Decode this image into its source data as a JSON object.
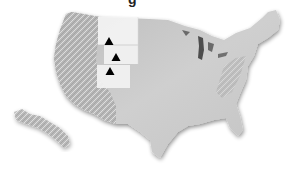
{
  "map": {
    "title_fragment": "g",
    "region": "Contiguous United States and Alaska (inset)",
    "style": "grayscale shaded relief",
    "colors": {
      "land": "#c9c9c9",
      "land_dark": "#a8a8a8",
      "highlight_state": "#f4f4f4",
      "lakes": "#555555",
      "marker": "#000000",
      "background": "#ffffff"
    },
    "highlighted_states": [
      "Montana",
      "Wyoming",
      "Colorado"
    ],
    "markers": [
      {
        "label": "Montana",
        "x": 109,
        "y": 41,
        "symbol": "triangle"
      },
      {
        "label": "Wyoming",
        "x": 116,
        "y": 57,
        "symbol": "triangle"
      },
      {
        "label": "Colorado",
        "x": 110,
        "y": 71,
        "symbol": "triangle"
      }
    ]
  }
}
